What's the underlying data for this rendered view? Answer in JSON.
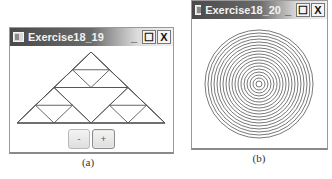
{
  "figure_a": {
    "window_title": "Exercise18_19",
    "controls": {
      "minimize": "_",
      "maximize": "☐",
      "close": "X"
    },
    "icon": "java-app-icon",
    "content": {
      "type": "sierpinski-triangle",
      "order": 2,
      "apex": [
        91,
        52
      ],
      "base_left": [
        17,
        123
      ],
      "base_right": [
        165,
        123
      ],
      "line_color": "#555555"
    },
    "buttons": [
      {
        "label": "-",
        "name": "decrease-order-button"
      },
      {
        "label": "+",
        "name": "increase-order-button"
      }
    ],
    "caption": "(a)"
  },
  "figure_b": {
    "window_title": "Exercise18_20",
    "controls": {
      "minimize": "_",
      "maximize": "☐",
      "close": "X"
    },
    "icon": "java-app-icon",
    "content": {
      "type": "concentric-circles",
      "center": [
        259,
        84
      ],
      "max_radius": 54,
      "spacing": 3,
      "count": 18,
      "line_color": "#555555"
    },
    "caption": "(b)"
  }
}
